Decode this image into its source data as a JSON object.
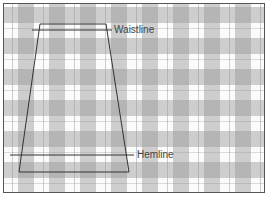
{
  "diagram": {
    "type": "gingham-fabric-skirt-layout",
    "colors": {
      "fabric_light": "#fbfbfb",
      "fabric_band": "#b4b4b4",
      "outline": "#333333",
      "frame": "#555555",
      "label_text": "#444444"
    },
    "labels": {
      "waistline": "Waistline",
      "hemline": "Hemline"
    },
    "skirt_outline": {
      "shape": "trapezoid",
      "points": [
        [
          40,
          24
        ],
        [
          106,
          24
        ],
        [
          129,
          172
        ],
        [
          19,
          172
        ]
      ]
    },
    "guide_lines": [
      {
        "name": "waistline",
        "y": 30,
        "x1": 32,
        "x2": 112
      },
      {
        "name": "hemline",
        "y": 155,
        "x1": 10,
        "x2": 134
      }
    ]
  }
}
